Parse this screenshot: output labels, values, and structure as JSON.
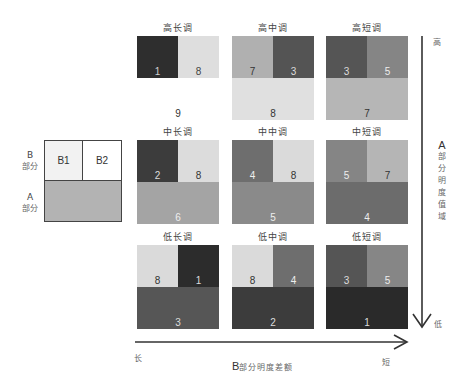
{
  "legend": {
    "b_label": "B",
    "b_sub": "部分",
    "a_label": "A",
    "a_sub": "部分",
    "b1": "B1",
    "b2": "B2"
  },
  "grid": {
    "rows": [
      {
        "tiles": [
          {
            "title": "高长调",
            "b1": {
              "value": "1",
              "color": "#2e2e2e",
              "text": "#cfcfcf"
            },
            "b2": {
              "value": "8",
              "color": "#dedede",
              "text": "#444444"
            },
            "a": {
              "value": "9",
              "color": "#ffffff",
              "text": "#333333"
            }
          },
          {
            "title": "高中调",
            "b1": {
              "value": "7",
              "color": "#b0b0b0",
              "text": "#333333"
            },
            "b2": {
              "value": "3",
              "color": "#545454",
              "text": "#dddddd"
            },
            "a": {
              "value": "8",
              "color": "#e0e0e0",
              "text": "#333333"
            }
          },
          {
            "title": "高短调",
            "b1": {
              "value": "3",
              "color": "#555555",
              "text": "#dddddd"
            },
            "b2": {
              "value": "5",
              "color": "#858585",
              "text": "#eeeeee"
            },
            "a": {
              "value": "7",
              "color": "#b6b6b6",
              "text": "#333333"
            }
          }
        ]
      },
      {
        "tiles": [
          {
            "title": "中长调",
            "b1": {
              "value": "2",
              "color": "#3c3c3c",
              "text": "#dddddd"
            },
            "b2": {
              "value": "8",
              "color": "#dcdcdc",
              "text": "#333333"
            },
            "a": {
              "value": "6",
              "color": "#a4a4a4",
              "text": "#eeeeee"
            }
          },
          {
            "title": "中中调",
            "b1": {
              "value": "4",
              "color": "#6e6e6e",
              "text": "#eeeeee"
            },
            "b2": {
              "value": "8",
              "color": "#dadada",
              "text": "#333333"
            },
            "a": {
              "value": "5",
              "color": "#8a8a8a",
              "text": "#eeeeee"
            }
          },
          {
            "title": "中短调",
            "b1": {
              "value": "5",
              "color": "#858585",
              "text": "#eeeeee"
            },
            "b2": {
              "value": "7",
              "color": "#b5b5b5",
              "text": "#333333"
            },
            "a": {
              "value": "4",
              "color": "#6c6c6c",
              "text": "#eeeeee"
            }
          }
        ]
      },
      {
        "tiles": [
          {
            "title": "低长调",
            "b1": {
              "value": "8",
              "color": "#dadada",
              "text": "#333333"
            },
            "b2": {
              "value": "1",
              "color": "#2c2c2c",
              "text": "#dddddd"
            },
            "a": {
              "value": "3",
              "color": "#565656",
              "text": "#dddddd"
            }
          },
          {
            "title": "低中调",
            "b1": {
              "value": "8",
              "color": "#dadada",
              "text": "#333333"
            },
            "b2": {
              "value": "4",
              "color": "#6e6e6e",
              "text": "#eeeeee"
            },
            "a": {
              "value": "2",
              "color": "#3c3c3c",
              "text": "#dddddd"
            }
          },
          {
            "title": "低短调",
            "b1": {
              "value": "3",
              "color": "#555555",
              "text": "#dddddd"
            },
            "b2": {
              "value": "5",
              "color": "#868686",
              "text": "#eeeeee"
            },
            "a": {
              "value": "1",
              "color": "#2a2a2a",
              "text": "#dddddd"
            }
          }
        ]
      }
    ]
  },
  "axes": {
    "vertical": {
      "top_label": "高",
      "bottom_label": "低",
      "title_letter": "A",
      "title_chars": [
        "部",
        "分",
        "明",
        "度",
        "值",
        "域"
      ]
    },
    "horizontal": {
      "left_label": "长",
      "right_label": "短",
      "title_letter": "B",
      "title_rest": "部分明度差额"
    }
  }
}
